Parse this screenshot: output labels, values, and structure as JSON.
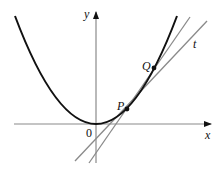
{
  "diagram": {
    "type": "secant-and-tangent-on-parabola",
    "colors": {
      "curve": "#111111",
      "axes": "#8a8a8a",
      "lines": "#8a8a8a",
      "points": "#111111",
      "background": "#ffffff"
    },
    "axes": {
      "x_label": "x",
      "y_label": "y",
      "origin_label": "0"
    },
    "points": {
      "P": {
        "label": "P"
      },
      "Q": {
        "label": "Q"
      }
    },
    "lines": {
      "tangent": {
        "label": "t"
      },
      "secant": {
        "label": ""
      }
    }
  }
}
